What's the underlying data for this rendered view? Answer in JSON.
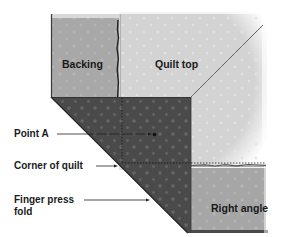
{
  "diagram": {
    "regions": {
      "backing": {
        "label": "Backing",
        "color": "#a8a8a8"
      },
      "quilt_top": {
        "label": "Quilt top",
        "color": "#d3d3d3"
      },
      "fold": {
        "color": "#4a4a4a"
      },
      "right_angle": {
        "label": "Right angle",
        "color": "#a6a6a6"
      }
    },
    "callouts": [
      {
        "id": "point-a",
        "label": "Point A"
      },
      {
        "id": "corner-of-quilt",
        "label": "Corner of quilt"
      },
      {
        "id": "finger-press-fold",
        "label_line1": "Finger press",
        "label_line2": "fold"
      }
    ],
    "colors": {
      "text": "#1a1a1a",
      "arrow": "#222222",
      "dotted_line": "#111111",
      "edge": "#2a2a2a"
    }
  }
}
